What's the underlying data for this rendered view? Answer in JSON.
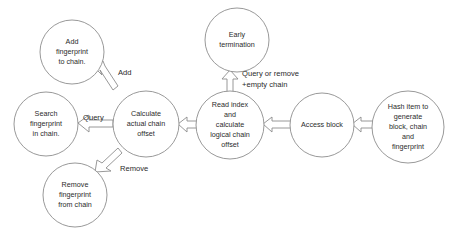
{
  "diagram": {
    "type": "flowchart",
    "background_color": "#ffffff",
    "stroke_color": "#8d8d8d",
    "text_color": "#2b2b2b",
    "nodes": [
      {
        "id": "add-fingerprint",
        "label": "Add fingerprint to chain.",
        "lines": [
          "Add",
          "fingerprint",
          "to chain."
        ],
        "cx": 72,
        "cy": 52,
        "r": 32
      },
      {
        "id": "search-fingerprint",
        "label": "Search fingerprint in chain.",
        "lines": [
          "Search",
          "fingerprint",
          "in chain."
        ],
        "cx": 46,
        "cy": 124,
        "r": 32
      },
      {
        "id": "remove-fingerprint",
        "label": "Remove fingerprint from chain",
        "lines": [
          "Remove",
          "fingerprint",
          "from chain"
        ],
        "cx": 75,
        "cy": 195,
        "r": 32
      },
      {
        "id": "calculate-actual-chain-offset",
        "label": "Calculate actual chain offset",
        "lines": [
          "Calculate",
          "actual chain",
          "offset"
        ],
        "cx": 146,
        "cy": 124,
        "r": 33
      },
      {
        "id": "early-termination",
        "label": "Early termination",
        "lines": [
          "Early",
          "termination"
        ],
        "cx": 237,
        "cy": 40,
        "r": 32
      },
      {
        "id": "read-index-calculate-logical-chain-offset",
        "label": "Read index and calculate logical chain offset",
        "lines": [
          "Read index",
          "and",
          "calculate",
          "logical chain",
          "offset"
        ],
        "cx": 230,
        "cy": 125,
        "r": 34
      },
      {
        "id": "access-block",
        "label": "Access block",
        "lines": [
          "Access block"
        ],
        "cx": 322,
        "cy": 125,
        "r": 32
      },
      {
        "id": "hash-item",
        "label": "Hash item to generate block, chain and fingerprint",
        "lines": [
          "Hash item to",
          "generate",
          "block, chain",
          "and",
          "fingerprint"
        ],
        "cx": 408,
        "cy": 127,
        "r": 36
      }
    ],
    "edges": [
      {
        "id": "edge-add",
        "from": "calculate-actual-chain-offset",
        "to": "add-fingerprint",
        "label": "Add",
        "label_x": 118,
        "label_y": 73
      },
      {
        "id": "edge-query",
        "from": "calculate-actual-chain-offset",
        "to": "search-fingerprint",
        "label": "Query",
        "label_x": 83,
        "label_y": 118
      },
      {
        "id": "edge-remove",
        "from": "calculate-actual-chain-offset",
        "to": "remove-fingerprint",
        "label": "Remove",
        "label_x": 120,
        "label_y": 169
      },
      {
        "id": "edge-early-termination",
        "from": "read-index-calculate-logical-chain-offset",
        "to": "early-termination",
        "label": "Query or remove +empty chain",
        "label_line_1": "Query or remove",
        "label_line_2": "+empty chain",
        "label_x": 242,
        "label_y": 74
      },
      {
        "id": "edge-read-to-calculate",
        "from": "read-index-calculate-logical-chain-offset",
        "to": "calculate-actual-chain-offset",
        "label": ""
      },
      {
        "id": "edge-access-to-read",
        "from": "access-block",
        "to": "read-index-calculate-logical-chain-offset",
        "label": ""
      },
      {
        "id": "edge-hash-to-access",
        "from": "hash-item",
        "to": "access-block",
        "label": ""
      }
    ]
  }
}
